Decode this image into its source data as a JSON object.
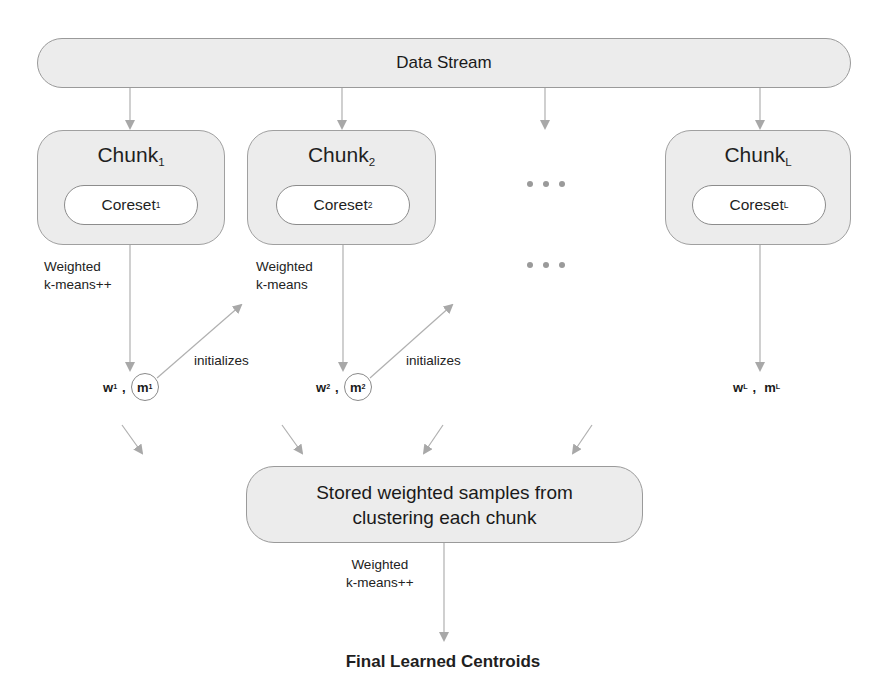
{
  "data_stream": {
    "label": "Data Stream"
  },
  "chunks": [
    {
      "title": "Chunk",
      "sub": "1",
      "coreset": "Coreset",
      "coreset_sub": "1"
    },
    {
      "title": "Chunk",
      "sub": "2",
      "coreset": "Coreset",
      "coreset_sub": "2"
    },
    {
      "title": "Chunk",
      "sub": "L",
      "coreset": "Coreset",
      "coreset_sub": "L"
    }
  ],
  "edge_labels": {
    "chunk1": {
      "line1": "Weighted",
      "line2": "k-means++"
    },
    "chunk2": {
      "line1": "Weighted",
      "line2": "k-means"
    },
    "initializes_1": "initializes",
    "initializes_2": "initializes",
    "final": {
      "line1": "Weighted",
      "line2": "k-means++"
    }
  },
  "outputs": [
    {
      "w": "w",
      "w_sub": "1",
      "sep": ",",
      "m": "m",
      "m_sub": "1"
    },
    {
      "w": "w",
      "w_sub": "2",
      "sep": ",",
      "m": "m",
      "m_sub": "2"
    },
    {
      "w": "w",
      "w_sub": "L",
      "sep": ",",
      "m": "m",
      "m_sub": "L"
    }
  ],
  "ellipsis": "...",
  "stored": {
    "line1": "Stored weighted samples from",
    "line2": "clustering each chunk"
  },
  "final": {
    "label": "Final Learned Centroids"
  },
  "colors": {
    "box_fill": "#ececec",
    "box_border": "#9a9a9a",
    "arrow": "#a8a8a8",
    "text": "#1a1a1a"
  }
}
